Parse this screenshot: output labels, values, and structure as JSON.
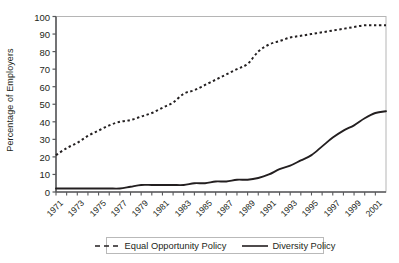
{
  "chart_data": {
    "type": "line",
    "title": "",
    "xlabel": "",
    "ylabel": "Percentage of Employers",
    "xlim": [
      1971,
      2002
    ],
    "ylim": [
      0,
      100
    ],
    "ytick_step": 10,
    "grid": false,
    "legend_position": "bottom",
    "ytick_labels": [
      "100",
      "90",
      "80",
      "70",
      "60",
      "50",
      "40",
      "30",
      "20",
      "10",
      "0"
    ],
    "ytick_values": [
      100,
      90,
      80,
      70,
      60,
      50,
      40,
      30,
      20,
      10,
      0
    ],
    "xtick_labels": [
      "1971",
      "1973",
      "1975",
      "1977",
      "1979",
      "1981",
      "1983",
      "1985",
      "1987",
      "1989",
      "1991",
      "1993",
      "1995",
      "1997",
      "1999",
      "2001"
    ],
    "xtick_values": [
      1971,
      1973,
      1975,
      1977,
      1979,
      1981,
      1983,
      1985,
      1987,
      1989,
      1991,
      1993,
      1995,
      1997,
      1999,
      2001
    ],
    "x": [
      1971,
      1972,
      1973,
      1974,
      1975,
      1976,
      1977,
      1978,
      1979,
      1980,
      1981,
      1982,
      1983,
      1984,
      1985,
      1986,
      1987,
      1988,
      1989,
      1990,
      1991,
      1992,
      1993,
      1994,
      1995,
      1996,
      1997,
      1998,
      1999,
      2000,
      2001,
      2002
    ],
    "series": [
      {
        "name": "Equal Opportunity Policy",
        "style": "dashed",
        "color": "#231f20",
        "values": [
          21,
          25,
          28,
          32,
          35,
          38,
          40,
          41,
          43,
          45,
          48,
          51,
          56,
          58,
          61,
          64,
          67,
          70,
          73,
          80,
          84,
          86,
          88,
          89,
          90,
          91,
          92,
          93,
          94,
          95,
          95,
          95
        ]
      },
      {
        "name": "Diversity Policy",
        "style": "solid",
        "color": "#231f20",
        "values": [
          2,
          2,
          2,
          2,
          2,
          2,
          2,
          3,
          4,
          4,
          4,
          4,
          4,
          5,
          5,
          6,
          6,
          7,
          7,
          8,
          10,
          13,
          15,
          18,
          21,
          26,
          31,
          35,
          38,
          42,
          45,
          46
        ]
      }
    ]
  },
  "legend": {
    "items": [
      {
        "label": "Equal Opportunity Policy",
        "style": "dashed"
      },
      {
        "label": "Diversity Policy",
        "style": "solid"
      }
    ]
  }
}
